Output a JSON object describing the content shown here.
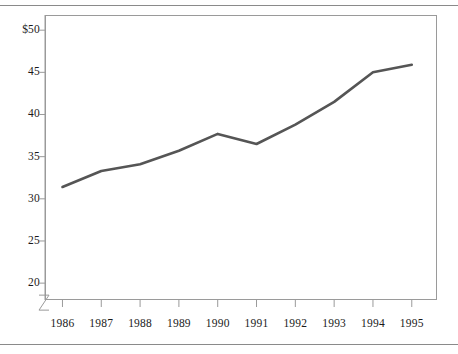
{
  "chart_data": {
    "type": "line",
    "title": "",
    "subtitle": "",
    "xlabel": "",
    "ylabel": "",
    "categories": [
      "1986",
      "1987",
      "1988",
      "1989",
      "1990",
      "1991",
      "1992",
      "1993",
      "1994",
      "1995"
    ],
    "x": [
      1986,
      1987,
      1988,
      1989,
      1990,
      1991,
      1992,
      1993,
      1994,
      1995
    ],
    "values": [
      31.4,
      33.3,
      34.1,
      35.7,
      37.7,
      36.5,
      38.8,
      41.5,
      45.0,
      45.9
    ],
    "series": [
      {
        "name": "",
        "values": [
          31.4,
          33.3,
          34.1,
          35.7,
          37.7,
          36.5,
          38.8,
          41.5,
          45.0,
          45.9
        ],
        "color": "#555555"
      }
    ],
    "ylim": [
      18,
      51.8
    ],
    "xlim": [
      1985.55,
      1995.65
    ],
    "y_ticks": [
      50,
      45,
      40,
      35,
      30,
      25,
      20
    ],
    "y_tick_labels": [
      "$50",
      "45",
      "40",
      "35",
      "30",
      "25",
      "20"
    ],
    "x_ticks": [
      1986,
      1987,
      1988,
      1989,
      1990,
      1991,
      1992,
      1993,
      1994,
      1995
    ],
    "x_tick_labels": [
      "1986",
      "1987",
      "1988",
      "1989",
      "1990",
      "1991",
      "1992",
      "1993",
      "1994",
      "1995"
    ],
    "grid": false,
    "legend": null,
    "legend_position": "none",
    "axis_break": true,
    "annotations": [],
    "colors": {
      "line": "#555555",
      "axis": "#9a9a9a",
      "text": "#1a1a1a",
      "rule": "#8a8a8a",
      "background": "#ffffff"
    }
  }
}
